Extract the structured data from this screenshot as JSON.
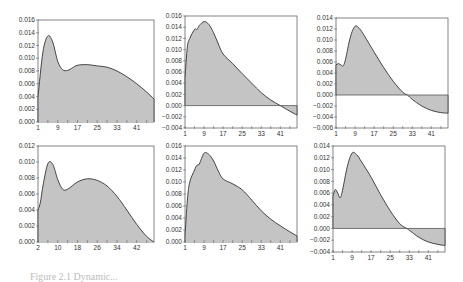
{
  "chart_data": [
    {
      "id": "top-left",
      "type": "area",
      "x_ticks": [
        "1",
        "9",
        "17",
        "25",
        "33",
        "41"
      ],
      "x_range": [
        1,
        48
      ],
      "y_ticks": [
        "0.016",
        "0.014",
        "0.012",
        "0.010",
        "0.008",
        "0.006",
        "0.004",
        "0.002",
        "0.000"
      ],
      "ylim": [
        0,
        0.016
      ],
      "x": [
        1,
        3,
        5,
        7,
        9,
        11,
        13,
        15,
        17,
        21,
        25,
        29,
        33,
        37,
        41,
        45,
        48
      ],
      "values": [
        0.004,
        0.011,
        0.0135,
        0.0125,
        0.0095,
        0.0082,
        0.0081,
        0.0085,
        0.0089,
        0.009,
        0.0088,
        0.0086,
        0.008,
        0.0071,
        0.006,
        0.0047,
        0.0036
      ],
      "frame": {
        "x": 38,
        "y": 20,
        "w": 116,
        "h": 102
      }
    },
    {
      "id": "top-middle",
      "type": "area",
      "x_ticks": [
        "1",
        "9",
        "17",
        "25",
        "33",
        "41"
      ],
      "x_range": [
        1,
        48
      ],
      "y_ticks": [
        "0.016",
        "0.014",
        "0.012",
        "0.010",
        "0.008",
        "0.006",
        "0.004",
        "0.002",
        "0.000",
        "-0.002",
        "-0.004"
      ],
      "ylim": [
        -0.004,
        0.016
      ],
      "x": [
        1,
        2,
        3,
        5,
        6,
        7,
        9,
        11,
        13,
        15,
        17,
        21,
        25,
        29,
        33,
        37,
        41,
        45,
        48
      ],
      "values": [
        0.005,
        0.0105,
        0.012,
        0.0136,
        0.0136,
        0.0143,
        0.015,
        0.0145,
        0.013,
        0.011,
        0.0092,
        0.0075,
        0.0057,
        0.004,
        0.0023,
        0.001,
        0.0,
        -0.001,
        -0.0017
      ],
      "frame": {
        "x": 185,
        "y": 16,
        "w": 112,
        "h": 112
      }
    },
    {
      "id": "top-right",
      "type": "area",
      "x_ticks": [
        "1",
        "9",
        "17",
        "25",
        "33",
        "41"
      ],
      "x_range": [
        1,
        48
      ],
      "y_ticks": [
        "0.014",
        "0.012",
        "0.010",
        "0.008",
        "0.006",
        "0.004",
        "0.002",
        "0.000",
        "-0.002",
        "-0.004",
        "-0.006"
      ],
      "ylim": [
        -0.006,
        0.014
      ],
      "x": [
        1,
        2,
        3,
        4,
        5,
        7,
        9,
        11,
        13,
        17,
        21,
        25,
        29,
        31,
        33,
        37,
        41,
        45,
        48
      ],
      "values": [
        0.0055,
        0.0057,
        0.0055,
        0.0053,
        0.0065,
        0.0105,
        0.0125,
        0.012,
        0.0107,
        0.0078,
        0.005,
        0.0025,
        0.0005,
        0.0,
        -0.0008,
        -0.002,
        -0.0028,
        -0.0032,
        -0.0033
      ],
      "frame": {
        "x": 336,
        "y": 18,
        "w": 112,
        "h": 110
      }
    },
    {
      "id": "bottom-left",
      "type": "area",
      "x_ticks": [
        "2",
        "10",
        "18",
        "26",
        "34",
        "42"
      ],
      "x_range": [
        2,
        49
      ],
      "y_ticks": [
        "0.012",
        "0.010",
        "0.008",
        "0.006",
        "0.004",
        "0.002",
        "0.000"
      ],
      "ylim": [
        0,
        0.012
      ],
      "x": [
        2,
        3,
        4,
        6,
        8,
        10,
        12,
        14,
        18,
        22,
        26,
        30,
        34,
        38,
        42,
        46,
        49
      ],
      "values": [
        0.004,
        0.005,
        0.007,
        0.0098,
        0.0097,
        0.0078,
        0.0066,
        0.0066,
        0.0075,
        0.0079,
        0.0077,
        0.007,
        0.0057,
        0.004,
        0.0022,
        0.0007,
        0.0
      ],
      "frame": {
        "x": 38,
        "y": 146,
        "w": 116,
        "h": 96
      }
    },
    {
      "id": "bottom-middle",
      "type": "area",
      "x_ticks": [
        "1",
        "9",
        "17",
        "25",
        "33",
        "41"
      ],
      "x_range": [
        1,
        48
      ],
      "y_ticks": [
        "0.016",
        "0.014",
        "0.012",
        "0.010",
        "0.008",
        "0.006",
        "0.004",
        "0.002",
        "0.000"
      ],
      "ylim": [
        0,
        0.016
      ],
      "x": [
        1,
        2,
        3,
        5,
        6,
        7,
        9,
        11,
        13,
        15,
        17,
        21,
        25,
        29,
        33,
        37,
        41,
        45,
        48
      ],
      "values": [
        0.001,
        0.007,
        0.01,
        0.012,
        0.0128,
        0.013,
        0.0148,
        0.0146,
        0.0135,
        0.0118,
        0.0105,
        0.0097,
        0.0087,
        0.007,
        0.0052,
        0.0038,
        0.0027,
        0.0017,
        0.001
      ],
      "frame": {
        "x": 185,
        "y": 146,
        "w": 112,
        "h": 96
      }
    },
    {
      "id": "bottom-right",
      "type": "area",
      "x_ticks": [
        "1",
        "9",
        "17",
        "25",
        "33",
        "41"
      ],
      "x_range": [
        1,
        48
      ],
      "y_ticks": [
        "0.014",
        "0.012",
        "0.010",
        "0.008",
        "0.006",
        "0.004",
        "0.002",
        "0.000",
        "-0.002",
        "-0.004"
      ],
      "ylim": [
        -0.004,
        0.014
      ],
      "x": [
        1,
        2,
        3,
        4,
        5,
        7,
        9,
        11,
        13,
        17,
        21,
        25,
        29,
        32,
        33,
        37,
        41,
        45,
        48
      ],
      "values": [
        0.0055,
        0.0066,
        0.006,
        0.0052,
        0.0065,
        0.0105,
        0.0128,
        0.0125,
        0.0113,
        0.0087,
        0.0057,
        0.003,
        0.0008,
        0.0,
        -0.0003,
        -0.0015,
        -0.0023,
        -0.0027,
        -0.0029
      ],
      "frame": {
        "x": 333,
        "y": 146,
        "w": 112,
        "h": 106
      }
    }
  ],
  "colors": {
    "fill": "#c4c4c4",
    "line": "#333333",
    "frame": "#666666",
    "zero_line": "#555555"
  },
  "caption": "Figure 2.1  Dynamic..."
}
